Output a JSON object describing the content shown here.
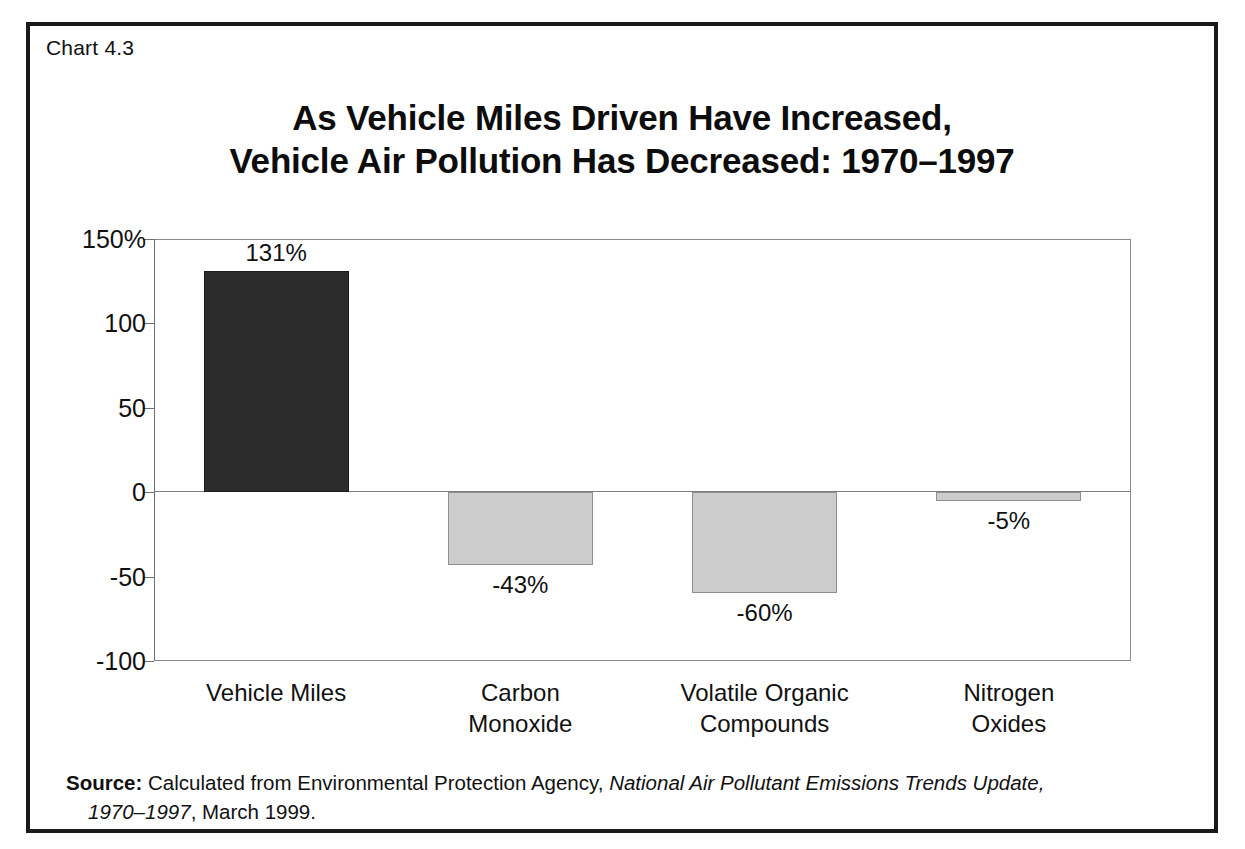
{
  "figure": {
    "chart_number": "Chart 4.3",
    "title_line1": "As Vehicle Miles Driven Have Increased,",
    "title_line2": "Vehicle Air Pollution Has Decreased: 1970–1997",
    "border_color": "#1a1a1a",
    "background_color": "#ffffff"
  },
  "source": {
    "label": "Source:",
    "text_before_italic": " Calculated from Environmental Protection Agency, ",
    "italic_part": "National Air Pollutant Emissions Trends Update,",
    "italic_part_line2": "1970–1997",
    "text_after_italic": ", March 1999."
  },
  "chart_data": {
    "type": "bar",
    "title": "As Vehicle Miles Driven Have Increased, Vehicle Air Pollution Has Decreased: 1970–1997",
    "xlabel": "",
    "ylabel": "",
    "categories": [
      "Vehicle Miles",
      "Carbon Monoxide",
      "Volatile Organic Compounds",
      "Nitrogen Oxides"
    ],
    "category_lines": [
      [
        "Vehicle Miles"
      ],
      [
        "Carbon",
        "Monoxide"
      ],
      [
        "Volatile Organic",
        "Compounds"
      ],
      [
        "Nitrogen",
        "Oxides"
      ]
    ],
    "values": [
      131,
      -43,
      -60,
      -5
    ],
    "value_labels": [
      "131%",
      "-43%",
      "-60%",
      "-5%"
    ],
    "bar_colors": [
      "#2c2c2c",
      "#cccccc",
      "#cccccc",
      "#cccccc"
    ],
    "ylim": [
      -100,
      150
    ],
    "yticks": [
      150,
      100,
      50,
      0,
      -50,
      -100
    ],
    "ytick_labels": [
      "150%",
      "100",
      "50",
      "0",
      "-50",
      "-100"
    ],
    "grid": false,
    "legend": "none",
    "zero_line": true
  }
}
